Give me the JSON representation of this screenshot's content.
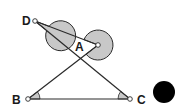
{
  "diagram": {
    "type": "geometry",
    "points": {
      "A": {
        "label": "A",
        "x": 98,
        "y": 45
      },
      "B": {
        "label": "B",
        "x": 28,
        "y": 99
      },
      "C": {
        "label": "C",
        "x": 130,
        "y": 99
      },
      "D": {
        "label": "D",
        "x": 35,
        "y": 21
      }
    },
    "segments": [
      [
        "D",
        "A"
      ],
      [
        "D",
        "C"
      ],
      [
        "A",
        "B"
      ],
      [
        "B",
        "C"
      ]
    ],
    "marked_angles": [
      {
        "vertex": "D",
        "style": "large-reflex-sector",
        "fill": "#c8c8c8"
      },
      {
        "vertex": "A",
        "style": "large-reflex-sector",
        "fill": "#c8c8c8"
      },
      {
        "vertex": "B",
        "style": "small-sector",
        "fill": "#c8c8c8"
      },
      {
        "vertex": "C",
        "style": "small-sector",
        "fill": "#c8c8c8"
      }
    ],
    "extra_shapes": [
      {
        "name": "black-dot",
        "x": 164,
        "y": 92,
        "r": 11,
        "fill": "#000000"
      }
    ],
    "colors": {
      "stroke": "#2a2a2a",
      "sector_fill": "#c8c8c8",
      "background": "#ffffff"
    }
  }
}
